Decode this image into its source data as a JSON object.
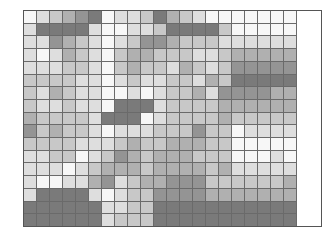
{
  "chart_data": {
    "type": "heatmap",
    "title": "",
    "xlabel": "",
    "ylabel": "",
    "rows": 17,
    "columns": 21,
    "legend": "none",
    "grid": true,
    "shade_scale": {
      "min": 0,
      "max": 5,
      "note": "0 = white/lightest, 5 = darkest gray"
    },
    "palette": [
      "#f7f7f7",
      "#dedede",
      "#c8c8c8",
      "#b0b0b0",
      "#949494",
      "#7a7a7a"
    ],
    "values": [
      [
        0,
        1,
        2,
        3,
        4,
        5,
        0,
        1,
        1,
        2,
        5,
        3,
        2,
        1,
        0,
        0,
        0,
        0,
        0,
        0,
        0
      ],
      [
        1,
        5,
        5,
        5,
        5,
        1,
        0,
        0,
        1,
        1,
        2,
        5,
        5,
        5,
        5,
        2,
        0,
        0,
        0,
        0,
        0
      ],
      [
        1,
        1,
        4,
        3,
        2,
        1,
        0,
        1,
        2,
        4,
        4,
        3,
        2,
        2,
        2,
        1,
        1,
        1,
        1,
        1,
        1
      ],
      [
        1,
        0,
        1,
        3,
        2,
        1,
        0,
        2,
        3,
        3,
        2,
        2,
        2,
        1,
        1,
        2,
        3,
        3,
        3,
        3,
        3
      ],
      [
        1,
        1,
        1,
        2,
        2,
        1,
        0,
        2,
        3,
        2,
        2,
        1,
        3,
        2,
        1,
        2,
        4,
        4,
        4,
        4,
        4
      ],
      [
        2,
        2,
        2,
        2,
        1,
        1,
        0,
        1,
        2,
        1,
        1,
        2,
        2,
        1,
        3,
        2,
        5,
        5,
        5,
        5,
        5
      ],
      [
        2,
        1,
        3,
        2,
        1,
        1,
        0,
        0,
        1,
        0,
        1,
        2,
        2,
        3,
        1,
        4,
        4,
        4,
        4,
        3,
        3
      ],
      [
        2,
        1,
        1,
        2,
        1,
        1,
        0,
        5,
        5,
        5,
        1,
        2,
        2,
        2,
        2,
        3,
        3,
        3,
        3,
        3,
        3
      ],
      [
        3,
        2,
        2,
        2,
        2,
        1,
        5,
        5,
        5,
        0,
        1,
        2,
        2,
        2,
        2,
        3,
        2,
        2,
        2,
        2,
        2
      ],
      [
        4,
        2,
        3,
        2,
        2,
        1,
        0,
        1,
        1,
        1,
        2,
        2,
        2,
        4,
        2,
        2,
        0,
        1,
        1,
        1,
        1
      ],
      [
        2,
        2,
        2,
        2,
        1,
        1,
        1,
        2,
        3,
        2,
        2,
        3,
        3,
        3,
        2,
        2,
        0,
        0,
        0,
        0,
        0
      ],
      [
        1,
        1,
        2,
        2,
        0,
        1,
        2,
        4,
        3,
        2,
        3,
        3,
        3,
        2,
        2,
        2,
        0,
        0,
        0,
        1,
        0
      ],
      [
        1,
        1,
        1,
        0,
        1,
        2,
        3,
        3,
        3,
        2,
        3,
        3,
        3,
        3,
        2,
        3,
        1,
        1,
        1,
        1,
        1
      ],
      [
        1,
        0,
        0,
        1,
        1,
        3,
        4,
        1,
        2,
        3,
        3,
        4,
        4,
        4,
        2,
        2,
        2,
        2,
        2,
        2,
        3
      ],
      [
        1,
        5,
        5,
        5,
        5,
        1,
        0,
        1,
        2,
        2,
        4,
        4,
        4,
        4,
        3,
        3,
        3,
        3,
        3,
        3,
        3
      ],
      [
        5,
        5,
        5,
        5,
        5,
        5,
        1,
        1,
        2,
        2,
        5,
        5,
        5,
        5,
        5,
        5,
        5,
        5,
        5,
        5,
        5
      ],
      [
        5,
        5,
        5,
        5,
        5,
        5,
        1,
        2,
        2,
        2,
        5,
        5,
        5,
        5,
        5,
        5,
        5,
        5,
        5,
        5,
        5
      ]
    ]
  }
}
